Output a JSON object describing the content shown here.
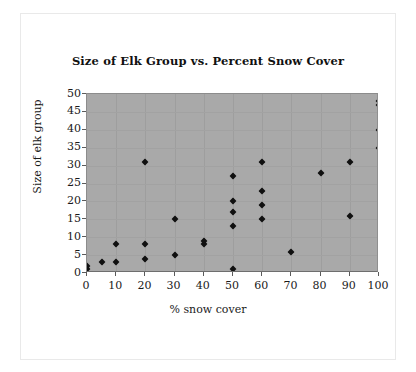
{
  "chart_data": {
    "type": "scatter",
    "title": "Size of Elk Group vs. Percent Snow Cover",
    "xlabel": "% snow cover",
    "ylabel": "Size of elk group",
    "xlim": [
      0,
      100
    ],
    "ylim": [
      0,
      50
    ],
    "xticks": [
      0,
      10,
      20,
      30,
      40,
      50,
      60,
      70,
      80,
      90,
      100
    ],
    "yticks": [
      0,
      5,
      10,
      15,
      20,
      25,
      30,
      35,
      40,
      45,
      50
    ],
    "xtick_labels": [
      "0",
      "10",
      "20",
      "30",
      "40",
      "50",
      "60",
      "70",
      "80",
      "90",
      "100"
    ],
    "ytick_labels": [
      "0",
      "5",
      "10",
      "15",
      "20",
      "25",
      "30",
      "35",
      "40",
      "45",
      "50"
    ],
    "grid": true,
    "legend": null,
    "marker": "diamond",
    "marker_color": "#101010",
    "plot_background": "#a9a9a9",
    "page_background": "#ffffff",
    "points": [
      {
        "x": 0,
        "y": 1
      },
      {
        "x": 0,
        "y": 2
      },
      {
        "x": 5,
        "y": 3
      },
      {
        "x": 10,
        "y": 3
      },
      {
        "x": 10,
        "y": 8
      },
      {
        "x": 20,
        "y": 4
      },
      {
        "x": 20,
        "y": 8
      },
      {
        "x": 20,
        "y": 31
      },
      {
        "x": 30,
        "y": 5
      },
      {
        "x": 30,
        "y": 15
      },
      {
        "x": 40,
        "y": 8
      },
      {
        "x": 40,
        "y": 9
      },
      {
        "x": 50,
        "y": 1
      },
      {
        "x": 50,
        "y": 13
      },
      {
        "x": 50,
        "y": 17
      },
      {
        "x": 50,
        "y": 20
      },
      {
        "x": 50,
        "y": 27
      },
      {
        "x": 60,
        "y": 15
      },
      {
        "x": 60,
        "y": 19
      },
      {
        "x": 60,
        "y": 23
      },
      {
        "x": 60,
        "y": 31
      },
      {
        "x": 70,
        "y": 6
      },
      {
        "x": 80,
        "y": 28
      },
      {
        "x": 90,
        "y": 16
      },
      {
        "x": 90,
        "y": 31
      },
      {
        "x": 100,
        "y": 35
      },
      {
        "x": 100,
        "y": 40
      },
      {
        "x": 100,
        "y": 47
      },
      {
        "x": 100,
        "y": 48
      }
    ]
  }
}
